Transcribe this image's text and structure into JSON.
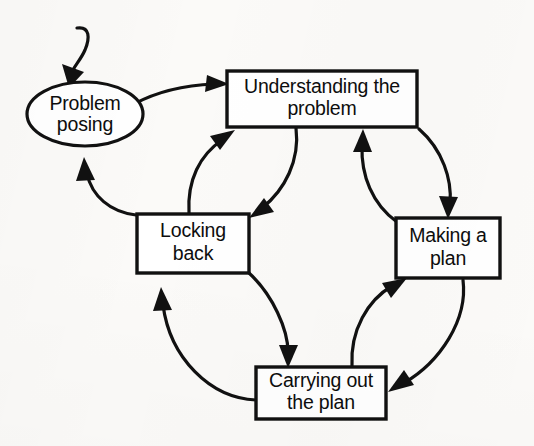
{
  "diagram": {
    "type": "flow-cycle",
    "background_color": "#fbfaf8",
    "line_color": "#111111",
    "text_color": "#0d0d0d",
    "nodes": [
      {
        "id": "problem-posing",
        "shape": "ellipse",
        "lines": [
          "Problem",
          "posing"
        ],
        "line1": "Problem",
        "line2": "posing",
        "cx": 85,
        "cy": 114,
        "rx": 58,
        "ry": 32
      },
      {
        "id": "understanding-the-problem",
        "shape": "rectangle",
        "lines": [
          "Understanding the",
          "problem"
        ],
        "line1": "Understanding the",
        "line2": "problem",
        "x": 227,
        "y": 71,
        "width": 190,
        "height": 56
      },
      {
        "id": "locking-back",
        "shape": "rectangle",
        "lines": [
          "Locking",
          "back"
        ],
        "line1": "Locking",
        "line2": "back",
        "x": 137,
        "y": 214,
        "width": 112,
        "height": 59
      },
      {
        "id": "making-a-plan",
        "shape": "rectangle",
        "lines": [
          "Making a",
          "plan"
        ],
        "line1": "Making a",
        "line2": "plan",
        "x": 396,
        "y": 218,
        "width": 104,
        "height": 60
      },
      {
        "id": "carrying-out-the-plan",
        "shape": "rectangle",
        "lines": [
          "Carrying out",
          "the plan"
        ],
        "line1": "Carrying out",
        "line2": "the plan",
        "x": 256,
        "y": 367,
        "width": 130,
        "height": 52
      }
    ],
    "edges": [
      {
        "id": "entry-to-problem-posing",
        "from": "",
        "to": "problem-posing",
        "style": "curved-hook"
      },
      {
        "id": "problem-posing-to-understanding",
        "from": "problem-posing",
        "to": "understanding-the-problem",
        "style": "curved"
      },
      {
        "id": "understanding-to-locking-back",
        "from": "understanding-the-problem",
        "to": "locking-back",
        "style": "curved"
      },
      {
        "id": "locking-back-to-understanding",
        "from": "locking-back",
        "to": "understanding-the-problem",
        "style": "curved"
      },
      {
        "id": "understanding-to-making-a-plan",
        "from": "understanding-the-problem",
        "to": "making-a-plan",
        "style": "curved"
      },
      {
        "id": "making-a-plan-to-understanding",
        "from": "making-a-plan",
        "to": "understanding-the-problem",
        "style": "curved"
      },
      {
        "id": "making-a-plan-to-carrying-out",
        "from": "making-a-plan",
        "to": "carrying-out-the-plan",
        "style": "curved"
      },
      {
        "id": "carrying-out-to-making-a-plan",
        "from": "carrying-out-the-plan",
        "to": "making-a-plan",
        "style": "curved"
      },
      {
        "id": "locking-back-to-carrying-out",
        "from": "locking-back",
        "to": "carrying-out-the-plan",
        "style": "curved"
      },
      {
        "id": "carrying-out-to-locking-back",
        "from": "carrying-out-the-plan",
        "to": "locking-back",
        "style": "curved"
      },
      {
        "id": "locking-back-to-problem-posing",
        "from": "locking-back",
        "to": "problem-posing",
        "style": "curved"
      }
    ]
  }
}
